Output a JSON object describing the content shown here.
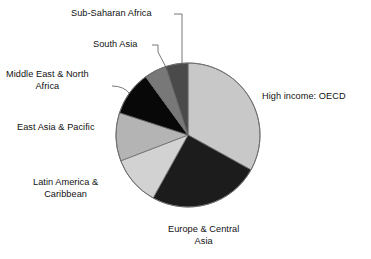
{
  "chart_data": {
    "type": "pie",
    "title": "",
    "subtitle": "",
    "xlabel": "",
    "ylabel": "",
    "legend_position": "none",
    "grid": false,
    "labels_placement": "outside-with-leader-lines",
    "start_angle_deg": 0,
    "direction": "clockwise",
    "categories": [
      "High income: OECD",
      "Europe & Central Asia",
      "Latin America & Caribbean",
      "East Asia & Pacific",
      "Middle East & North Africa",
      "South Asia",
      "Sub-Saharan Africa"
    ],
    "values": [
      33,
      25,
      11,
      11,
      10,
      5,
      5
    ],
    "slices": [
      {
        "name": "High income: OECD",
        "label_lines": [
          "High income: OECD"
        ],
        "value": 33,
        "color": "#c8c8c8",
        "start_angle_deg": 0,
        "end_angle_deg": 119,
        "has_leader_line": false
      },
      {
        "name": "Europe & Central Asia",
        "label_lines": [
          "Europe & Central",
          "Asia"
        ],
        "value": 25,
        "color": "#1c1c1c",
        "start_angle_deg": 119,
        "end_angle_deg": 209,
        "has_leader_line": false
      },
      {
        "name": "Latin America & Caribbean",
        "label_lines": [
          "Latin America &",
          "Caribbean"
        ],
        "value": 11,
        "color": "#d2d2d2",
        "start_angle_deg": 209,
        "end_angle_deg": 249,
        "has_leader_line": false
      },
      {
        "name": "East Asia & Pacific",
        "label_lines": [
          "East Asia & Pacific"
        ],
        "value": 11,
        "color": "#b4b4b4",
        "start_angle_deg": 249,
        "end_angle_deg": 288,
        "has_leader_line": false
      },
      {
        "name": "Middle East & North Africa",
        "label_lines": [
          "Middle East & North",
          "Africa"
        ],
        "value": 10,
        "color": "#080808",
        "start_angle_deg": 288,
        "end_angle_deg": 324,
        "has_leader_line": true
      },
      {
        "name": "South Asia",
        "label_lines": [
          "South Asia"
        ],
        "value": 5,
        "color": "#787878",
        "start_angle_deg": 324,
        "end_angle_deg": 342,
        "has_leader_line": true
      },
      {
        "name": "Sub-Saharan Africa",
        "label_lines": [
          "Sub-Saharan Africa"
        ],
        "value": 5,
        "color": "#4a4a4a",
        "start_angle_deg": 342,
        "end_angle_deg": 360,
        "has_leader_line": true
      }
    ]
  },
  "labels": {
    "sub_saharan_africa": "Sub-Saharan Africa",
    "south_asia": "South Asia",
    "middle_east_line1": "Middle East & North",
    "middle_east_line2": "Africa",
    "east_asia_pacific": "East Asia & Pacific",
    "latin_america_line1": "Latin America &",
    "latin_america_line2": "Caribbean",
    "europe_central_line1": "Europe & Central",
    "europe_central_line2": "Asia",
    "high_income_oecd": "High income: OECD"
  },
  "colors": {
    "background": "#ffffff",
    "text": "#111111",
    "outline": "#6b6b6b",
    "leader_line": "#555555",
    "high_income_oecd": "#c8c8c8",
    "europe_central_asia": "#1c1c1c",
    "latin_america_caribbean": "#d2d2d2",
    "east_asia_pacific": "#b4b4b4",
    "middle_east_north_africa": "#080808",
    "south_asia": "#787878",
    "sub_saharan_africa": "#4a4a4a"
  }
}
